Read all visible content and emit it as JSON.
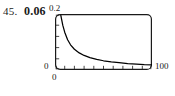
{
  "figure": {
    "problem_number": "45.",
    "answer_value": "0.06"
  },
  "chart_data": {
    "type": "line",
    "title": "",
    "xlabel": "",
    "ylabel": "",
    "xlim": [
      0,
      100
    ],
    "ylim": [
      0,
      0.2
    ],
    "grid": false,
    "legend": null,
    "axis_labels": {
      "y_max": "0.2",
      "y_min": "0",
      "x_min": "0",
      "x_max": "100"
    },
    "x_ticks": [
      0,
      10,
      20,
      30,
      40,
      50,
      60,
      70,
      80,
      90,
      100
    ],
    "x_tick_labels": [
      "0",
      "",
      "",
      "",
      "",
      "",
      "",
      "",
      "",
      "",
      "100"
    ],
    "y_ticks": [
      0,
      0.04,
      0.08,
      0.12,
      0.16,
      0.2
    ],
    "y_tick_labels": [
      "0",
      "",
      "",
      "",
      "",
      "0.2"
    ],
    "series": [
      {
        "name": "decay-curve",
        "color": "#000000",
        "x": [
          6,
          8,
          10,
          13,
          16,
          20,
          25,
          30,
          36,
          43,
          50,
          58,
          66,
          75,
          84,
          92,
          100
        ],
        "y": [
          0.195,
          0.16,
          0.135,
          0.108,
          0.09,
          0.074,
          0.061,
          0.052,
          0.044,
          0.038,
          0.033,
          0.029,
          0.026,
          0.023,
          0.021,
          0.019,
          0.018
        ]
      }
    ]
  },
  "colors": {
    "curve": "#000000",
    "frame": "#1a1a1a",
    "text": "#1a1a1a",
    "background": "#ffffff"
  }
}
